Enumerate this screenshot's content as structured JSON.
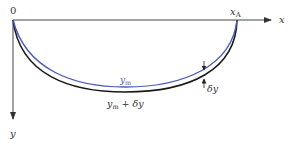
{
  "diagram": {
    "origin_label": "0",
    "x_axis_label": "x",
    "y_axis_label": "y",
    "endpoint_label": "x",
    "endpoint_subscript": "A",
    "inner_curve_label": "y",
    "inner_curve_subscript": "m",
    "outer_curve_label_main": "y",
    "outer_curve_label_sub": "m",
    "outer_curve_label_rest": " + δy",
    "gap_label": "δy",
    "colors": {
      "inner_curve": "#4a5bb5",
      "outer_curve": "#1a1a1a",
      "axes": "#333333"
    }
  }
}
